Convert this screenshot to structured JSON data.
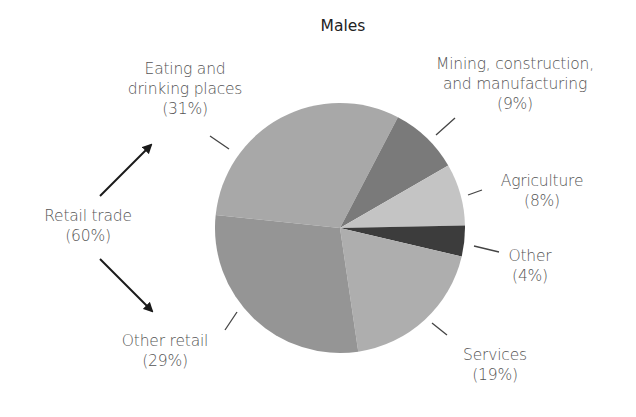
{
  "chart_data": {
    "type": "pie",
    "title": "Males",
    "slices": [
      {
        "label": "Eating and drinking places",
        "value": 31,
        "pct_label": "(31%)",
        "color": "#a8a8a8"
      },
      {
        "label": "Mining, construction, and manufacturing",
        "value": 9,
        "pct_label": "(9%)",
        "color": "#7a7a7a"
      },
      {
        "label": "Agriculture",
        "value": 8,
        "pct_label": "(8%)",
        "color": "#c4c4c4"
      },
      {
        "label": "Other",
        "value": 4,
        "pct_label": "(4%)",
        "color": "#3c3c3c"
      },
      {
        "label": "Services",
        "value": 19,
        "pct_label": "(19%)",
        "color": "#aeaeae"
      },
      {
        "label": "Other retail",
        "value": 29,
        "pct_label": "(29%)",
        "color": "#959595"
      }
    ],
    "group_annotation": {
      "label": "Retail trade",
      "value": 60,
      "pct_label": "(60%)",
      "members": [
        "Eating and drinking places",
        "Other retail"
      ]
    },
    "legend": "none (direct labels)"
  },
  "labels": {
    "title": "Males",
    "eating_l1": "Eating and",
    "eating_l2": "drinking places",
    "eating_pct": "(31%)",
    "mining_l1": "Mining, construction,",
    "mining_l2": "and manufacturing",
    "mining_pct": "(9%)",
    "agri_l1": "Agriculture",
    "agri_pct": "(8%)",
    "other_l1": "Other",
    "other_pct": "(4%)",
    "services_l1": "Services",
    "services_pct": "(19%)",
    "otherretail_l1": "Other retail",
    "otherretail_pct": "(29%)",
    "retail_l1": "Retail trade",
    "retail_pct": "(60%)"
  }
}
